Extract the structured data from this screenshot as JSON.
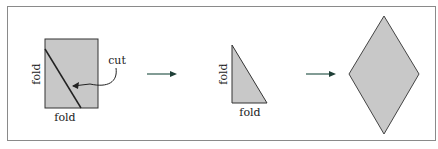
{
  "diagram": {
    "step1": {
      "shape": "rectangle",
      "labels": {
        "left": "fold",
        "bottom": "fold",
        "callout": "cut"
      }
    },
    "step2": {
      "shape": "right-triangle",
      "labels": {
        "left": "fold",
        "bottom": "fold"
      }
    },
    "step3": {
      "shape": "rhombus"
    },
    "arrows": [
      "arrow-1",
      "arrow-2"
    ],
    "colors": {
      "fill": "#c8c8c8",
      "stroke": "#333333",
      "arrow": "#2e5a4e",
      "border": "#8a8a8a"
    }
  }
}
